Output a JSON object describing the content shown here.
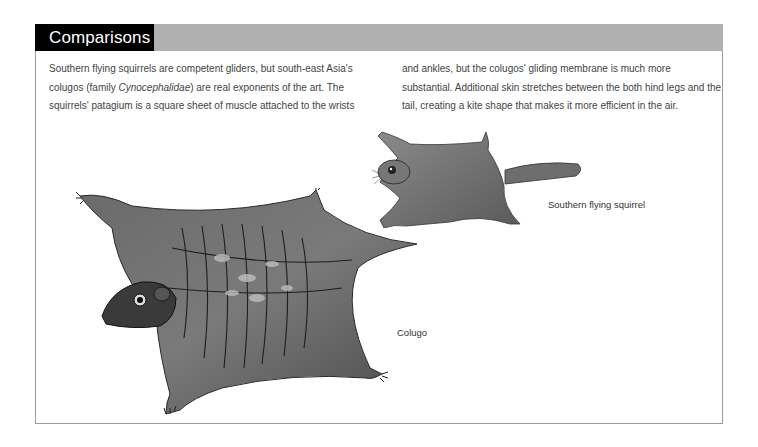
{
  "section": {
    "title": "Comparisons"
  },
  "body_text": {
    "column_1": {
      "part_1": "Southern flying squirrels are competent gliders, but south-east Asia's colugos (family ",
      "italic": "Cynocephalidae",
      "part_2": ") are real exponents of the art. The squirrels' patagium is a square sheet of muscle attached to the wrists"
    },
    "column_2": "and ankles, but the colugos' gliding membrane is much more substantial. Additional skin stretches between the both hind legs and the tail, creating a kite shape that makes it more efficient in the air."
  },
  "illustrations": [
    {
      "id": "squirrel",
      "caption": "Southern flying squirrel"
    },
    {
      "id": "colugo",
      "caption": "Colugo"
    }
  ],
  "colors": {
    "title_bg": "#000000",
    "bar_bg": "#b0b0b0",
    "border": "#9a9a9a"
  }
}
